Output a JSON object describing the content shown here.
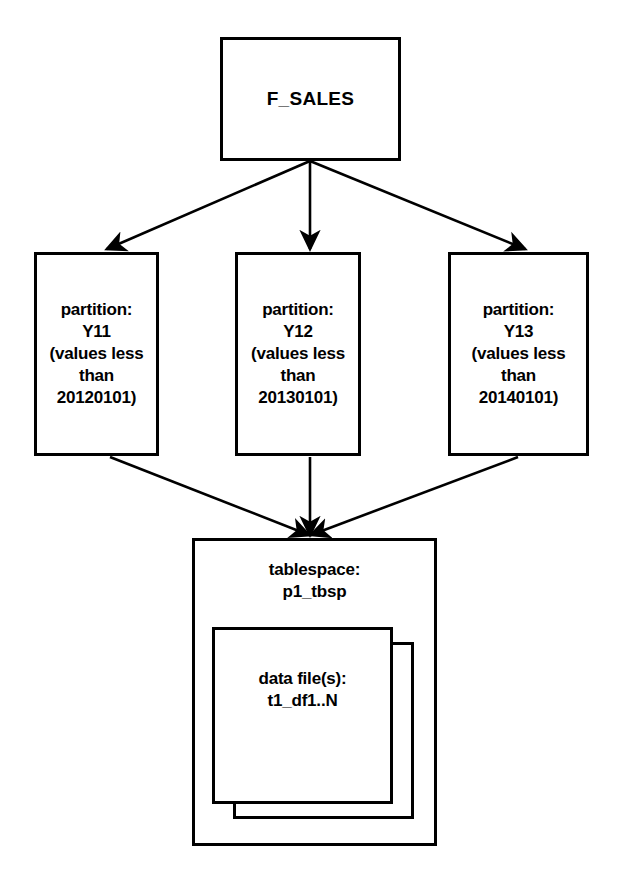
{
  "diagram": {
    "line_color": "#000000",
    "background_color": "#ffffff",
    "root": {
      "label": "F_SALES"
    },
    "partitions": [
      {
        "label": "partition:\nY11\n(values less\nthan\n20120101)",
        "name": "Y11",
        "rule": "values less than 20120101"
      },
      {
        "label": "partition:\nY12\n(values less\nthan\n20130101)",
        "name": "Y12",
        "rule": "values less than 20130101"
      },
      {
        "label": "partition:\nY13\n(values less\nthan\n20140101)",
        "name": "Y13",
        "rule": "values less than 20140101"
      }
    ],
    "tablespace": {
      "label": "tablespace:\np1_tbsp",
      "name": "p1_tbsp"
    },
    "datafiles": {
      "label": "data file(s):\nt1_df1..N",
      "name": "t1_df1..N"
    }
  }
}
